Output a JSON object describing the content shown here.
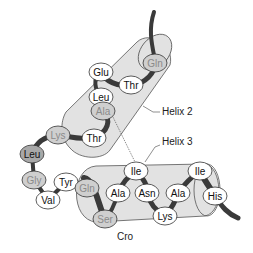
{
  "diagram": {
    "title": "Cro",
    "labels": {
      "helix2": "Helix 2",
      "helix3": "Helix 3"
    },
    "colors": {
      "cylinder_fill": "#e2e2e2",
      "cylinder_stroke": "#555555",
      "backbone": "#3a3a3a",
      "residue_exposed_fill": "#ffffff",
      "residue_buried_fill": "#cfcfcf",
      "residue_dark_fill": "#a8a8a8",
      "text_dark": "#111111",
      "text_grey": "#8a8a8a"
    },
    "residues": [
      {
        "id": "gln1",
        "label": "Gln",
        "x": 155,
        "y": 63,
        "style": "buried"
      },
      {
        "id": "glu",
        "label": "Glu",
        "x": 101,
        "y": 72,
        "style": "exposed"
      },
      {
        "id": "thr1",
        "label": "Thr",
        "x": 131,
        "y": 85,
        "style": "exposed"
      },
      {
        "id": "leu1",
        "label": "Leu",
        "x": 101,
        "y": 97,
        "style": "exposed"
      },
      {
        "id": "ala1",
        "label": "Ala",
        "x": 103,
        "y": 111,
        "style": "buried"
      },
      {
        "id": "lys1",
        "label": "Lys",
        "x": 58,
        "y": 135,
        "style": "buried"
      },
      {
        "id": "thr2",
        "label": "Thr",
        "x": 94,
        "y": 138,
        "style": "exposed"
      },
      {
        "id": "leu2",
        "label": "Leu",
        "x": 32,
        "y": 154,
        "style": "dark"
      },
      {
        "id": "gly",
        "label": "Gly",
        "x": 34,
        "y": 180,
        "style": "buried"
      },
      {
        "id": "val",
        "label": "Val",
        "x": 48,
        "y": 200,
        "style": "exposed"
      },
      {
        "id": "tyr",
        "label": "Tyr",
        "x": 66,
        "y": 182,
        "style": "exposed"
      },
      {
        "id": "gln2",
        "label": "Gln",
        "x": 87,
        "y": 188,
        "style": "buried"
      },
      {
        "id": "ile1",
        "label": "Ile",
        "x": 136,
        "y": 171,
        "style": "exposed"
      },
      {
        "id": "ala2",
        "label": "Ala",
        "x": 118,
        "y": 193,
        "style": "exposed"
      },
      {
        "id": "asn",
        "label": "Asn",
        "x": 147,
        "y": 193,
        "style": "exposed"
      },
      {
        "id": "ala3",
        "label": "Ala",
        "x": 178,
        "y": 193,
        "style": "exposed"
      },
      {
        "id": "ile2",
        "label": "Ile",
        "x": 200,
        "y": 171,
        "style": "exposed"
      },
      {
        "id": "his",
        "label": "His",
        "x": 215,
        "y": 196,
        "style": "exposed"
      },
      {
        "id": "ser",
        "label": "Ser",
        "x": 105,
        "y": 219,
        "style": "buried"
      },
      {
        "id": "lys2",
        "label": "Lys",
        "x": 165,
        "y": 216,
        "style": "exposed"
      }
    ]
  }
}
